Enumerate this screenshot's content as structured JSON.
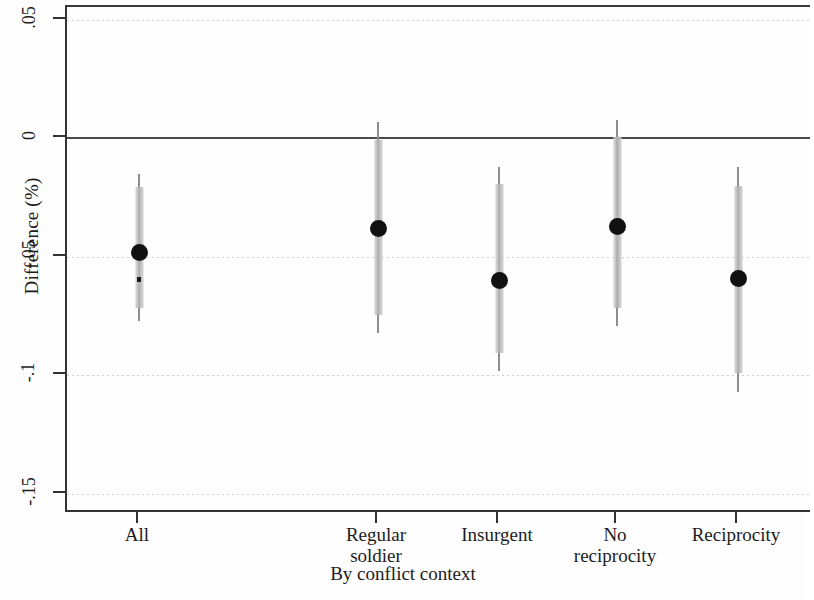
{
  "chart_data": {
    "type": "scatter",
    "title": "",
    "xlabel": "By conflict context",
    "ylabel": "Difference (%)",
    "ylim": [
      -0.1585,
      0.0555
    ],
    "yticks": [
      0.05,
      0,
      -0.05,
      -0.1,
      -0.15
    ],
    "ytick_labels": [
      ".05",
      "0",
      "-.05",
      "-.1",
      "-.15"
    ],
    "grid": true,
    "grid_axis": "y",
    "zero_reference_line": 0,
    "legend": "none",
    "categories": [
      "All",
      "Regular soldier",
      "Insurgent",
      "No reciprocity",
      "Reciprocity"
    ],
    "category_labels": [
      [
        "All"
      ],
      [
        "Regular",
        "soldier"
      ],
      [
        "Insurgent"
      ],
      [
        "No",
        "reciprocity"
      ],
      [
        "Reciprocity"
      ]
    ],
    "series": [
      {
        "name": "Difference with 95% CI",
        "marker": "filled-circle",
        "color": "#111111",
        "ci_color": "#b5b5b5",
        "points": [
          {
            "category": "All",
            "value": -0.048,
            "ci_low": -0.077,
            "ci_high": -0.015
          },
          {
            "category": "Regular soldier",
            "value": -0.038,
            "ci_low": -0.082,
            "ci_high": 0.007
          },
          {
            "category": "Insurgent",
            "value": -0.06,
            "ci_low": -0.098,
            "ci_high": -0.012
          },
          {
            "category": "No reciprocity",
            "value": -0.037,
            "ci_low": -0.079,
            "ci_high": 0.008
          },
          {
            "category": "Reciprocity",
            "value": -0.059,
            "ci_low": -0.107,
            "ci_high": -0.012
          }
        ]
      }
    ]
  },
  "geometry": {
    "x_positions": [
      137,
      376,
      497,
      615,
      736
    ]
  }
}
